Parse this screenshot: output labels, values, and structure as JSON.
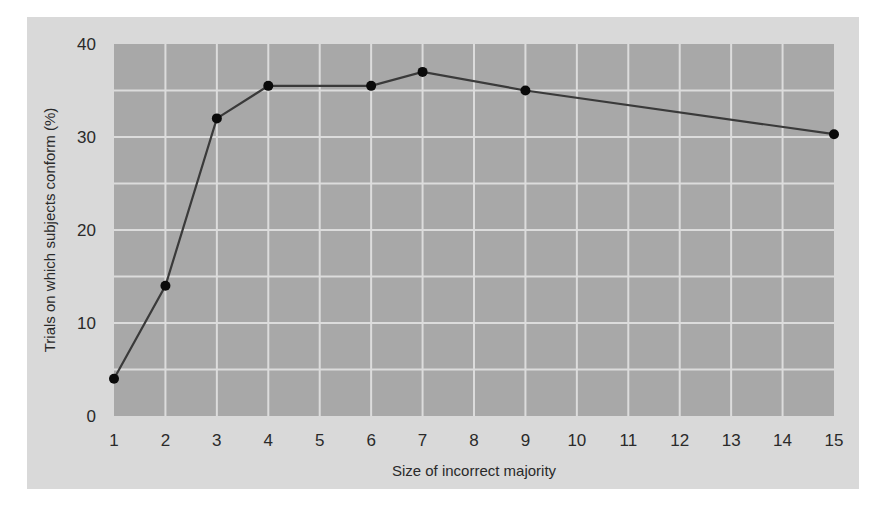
{
  "chart_data": {
    "type": "line",
    "title": "",
    "xlabel": "Size of incorrect majority",
    "ylabel": "Trials on which subjects conform (%)",
    "x_tick_labels": [
      "1",
      "2",
      "3",
      "4",
      "5",
      "6",
      "7",
      "8",
      "9",
      "10",
      "11",
      "12",
      "13",
      "14",
      "15"
    ],
    "y_tick_labels": [
      "0",
      "10",
      "20",
      "30",
      "40"
    ],
    "ylim": [
      0,
      40
    ],
    "grid": true,
    "legend": null,
    "series": [
      {
        "name": "Conformity",
        "x": [
          1,
          2,
          3,
          4,
          6,
          7,
          9,
          15
        ],
        "y": [
          4,
          14,
          32,
          35.5,
          35.5,
          37,
          35,
          30.3
        ]
      }
    ],
    "colors": {
      "panel_bg": "#d9d9d9",
      "plot_bg": "#a8a8a8",
      "grid": "#dcdcdc",
      "line": "#3a3a3a",
      "marker": "#0a0a0a"
    }
  },
  "labels": {
    "xlabel": "Size of incorrect majority",
    "ylabel": "Trials on which subjects conform (%)"
  }
}
